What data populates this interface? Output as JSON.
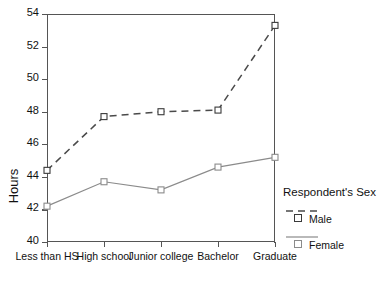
{
  "chart_data": {
    "type": "line",
    "title": "",
    "xlabel": "",
    "ylabel": "Hours",
    "ylim": [
      40,
      54
    ],
    "yticks": [
      40,
      42,
      44,
      46,
      48,
      50,
      52,
      54
    ],
    "grid": false,
    "legend_position": "right",
    "legend_title": "Respondent's Sex",
    "categories": [
      "Less than HS",
      "High school",
      "Junior college",
      "Bachelor",
      "Graduate"
    ],
    "series": [
      {
        "name": "Male",
        "style": "dashed",
        "marker": "open-square",
        "color": "#4a4a4a",
        "values": [
          44.4,
          47.7,
          48.0,
          48.1,
          53.3
        ]
      },
      {
        "name": "Female",
        "style": "solid",
        "marker": "open-square",
        "color": "#8b8b8b",
        "values": [
          42.2,
          43.7,
          43.2,
          44.6,
          45.2
        ]
      }
    ]
  },
  "axes": {
    "y_title": "Hours",
    "y_tick_labels": [
      "40",
      "42",
      "44",
      "46",
      "48",
      "50",
      "52",
      "54"
    ],
    "x_tick_labels": [
      "Less than HS",
      "High school",
      "Junior college",
      "Bachelor",
      "Graduate"
    ]
  },
  "legend": {
    "title": "Respondent's Sex",
    "entries": [
      {
        "label": "Male",
        "swatch": "dashed-line-square-marker"
      },
      {
        "label": "Female",
        "swatch": "solid-line-square-marker"
      }
    ]
  },
  "colors": {
    "male_line": "#4a4a4a",
    "female_line": "#8b8b8b",
    "axis": "#555555",
    "text": "#111111",
    "background": "#ffffff"
  }
}
